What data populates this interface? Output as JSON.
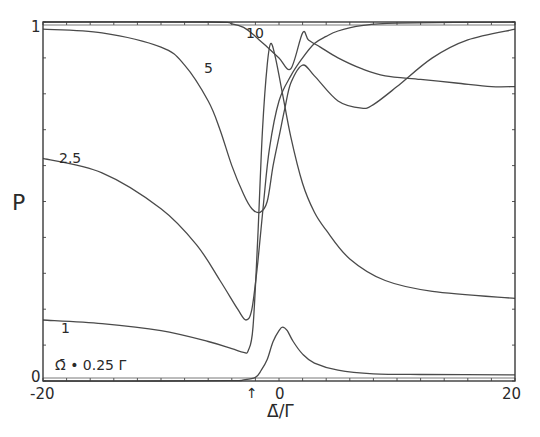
{
  "chart_data": {
    "type": "line",
    "title": "",
    "xlabel": "Δ̄/Γ",
    "ylabel": "P",
    "xlim": [
      -20,
      20
    ],
    "ylim": [
      0,
      1
    ],
    "x_ticks_labeled": [
      "-20",
      "0",
      "20"
    ],
    "y_ticks_labeled": [
      "0",
      "1"
    ],
    "minor_tick_spacing_x": 2,
    "minor_tick_spacing_y": 0.1,
    "grid": false,
    "legend": "inline curve labels",
    "annotations": [
      {
        "text": "Ω̄ = 0.25 Γ",
        "near_curve": "0.25"
      },
      {
        "text": "↑",
        "x": -2.3,
        "note": "arrow below x-axis"
      }
    ],
    "series": [
      {
        "name": "0.25",
        "label": "Ω̄ = 0.25 Γ",
        "points": [
          [
            -20,
            0.0
          ],
          [
            -10,
            0.0
          ],
          [
            -4,
            0.001
          ],
          [
            -3,
            0.003
          ],
          [
            -2,
            0.01
          ],
          [
            -1.5,
            0.03
          ],
          [
            -1,
            0.06
          ],
          [
            -0.5,
            0.11
          ],
          [
            0,
            0.14
          ],
          [
            0.3,
            0.15
          ],
          [
            0.7,
            0.14
          ],
          [
            1.2,
            0.11
          ],
          [
            2,
            0.075
          ],
          [
            3,
            0.05
          ],
          [
            5,
            0.03
          ],
          [
            8,
            0.02
          ],
          [
            12,
            0.018
          ],
          [
            20,
            0.017
          ]
        ]
      },
      {
        "name": "1",
        "label": "1",
        "points": [
          [
            -20,
            0.17
          ],
          [
            -15,
            0.16
          ],
          [
            -10,
            0.14
          ],
          [
            -6,
            0.11
          ],
          [
            -4,
            0.09
          ],
          [
            -3,
            0.08
          ],
          [
            -2.6,
            0.085
          ],
          [
            -2.2,
            0.15
          ],
          [
            -1.8,
            0.4
          ],
          [
            -1.4,
            0.7
          ],
          [
            -1.0,
            0.88
          ],
          [
            -0.7,
            0.94
          ],
          [
            -0.3,
            0.9
          ],
          [
            0.3,
            0.8
          ],
          [
            1,
            0.68
          ],
          [
            2,
            0.55
          ],
          [
            3,
            0.47
          ],
          [
            4,
            0.42
          ],
          [
            6,
            0.34
          ],
          [
            9,
            0.28
          ],
          [
            13,
            0.25
          ],
          [
            20,
            0.23
          ]
        ]
      },
      {
        "name": "2.5",
        "label": "2.5",
        "points": [
          [
            -20,
            0.62
          ],
          [
            -15,
            0.58
          ],
          [
            -10,
            0.48
          ],
          [
            -7,
            0.38
          ],
          [
            -5,
            0.28
          ],
          [
            -3.5,
            0.2
          ],
          [
            -2.8,
            0.17
          ],
          [
            -2.3,
            0.2
          ],
          [
            -1.8,
            0.33
          ],
          [
            -1.3,
            0.5
          ],
          [
            -0.8,
            0.65
          ],
          [
            0,
            0.78
          ],
          [
            1,
            0.85
          ],
          [
            2,
            0.9
          ],
          [
            3,
            0.94
          ],
          [
            4,
            0.96
          ],
          [
            5,
            0.975
          ],
          [
            7,
            0.99
          ],
          [
            10,
            0.997
          ],
          [
            20,
            1.0
          ]
        ]
      },
      {
        "name": "5",
        "label": "5",
        "points": [
          [
            -20,
            0.98
          ],
          [
            -15,
            0.97
          ],
          [
            -10,
            0.93
          ],
          [
            -8,
            0.88
          ],
          [
            -6,
            0.78
          ],
          [
            -5,
            0.7
          ],
          [
            -4,
            0.6
          ],
          [
            -3,
            0.52
          ],
          [
            -2.3,
            0.48
          ],
          [
            -1.6,
            0.47
          ],
          [
            -1,
            0.5
          ],
          [
            -0.5,
            0.6
          ],
          [
            0,
            0.68
          ],
          [
            0.5,
            0.76
          ],
          [
            1,
            0.83
          ],
          [
            2,
            0.88
          ],
          [
            3,
            0.85
          ],
          [
            5,
            0.78
          ],
          [
            7,
            0.76
          ],
          [
            8,
            0.77
          ],
          [
            10,
            0.82
          ],
          [
            13,
            0.9
          ],
          [
            16,
            0.95
          ],
          [
            20,
            0.98
          ]
        ]
      },
      {
        "name": "10",
        "label": "10",
        "points": [
          [
            -20,
            1.0
          ],
          [
            -6,
            1.0
          ],
          [
            -4,
            0.995
          ],
          [
            -3,
            0.985
          ],
          [
            -2,
            0.96
          ],
          [
            -1,
            0.93
          ],
          [
            0,
            0.9
          ],
          [
            1,
            0.87
          ],
          [
            2,
            0.97
          ],
          [
            2.5,
            0.95
          ],
          [
            3.5,
            0.93
          ],
          [
            5,
            0.9
          ],
          [
            7,
            0.87
          ],
          [
            9,
            0.85
          ],
          [
            12,
            0.84
          ],
          [
            15,
            0.83
          ],
          [
            18,
            0.82
          ],
          [
            20,
            0.82
          ]
        ]
      }
    ]
  },
  "labels": {
    "y_axis_title": "P",
    "x_axis_title": "Δ̄/Γ",
    "y_tick_top": "1",
    "y_tick_bottom": "0",
    "x_tick_left": "-20",
    "x_tick_mid": "0",
    "x_tick_right": "20",
    "arrow": "↑",
    "curve_10": "10",
    "curve_5": "5",
    "curve_2_5": "2.5",
    "curve_1": "1",
    "curve_025": "Ω̄ • 0.25 Γ"
  }
}
